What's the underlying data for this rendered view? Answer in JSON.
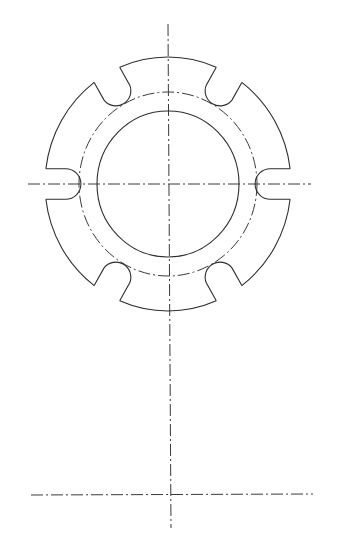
{
  "drawing": {
    "title": "Flange plate with radial slots",
    "type": "technical-drawing",
    "colors": {
      "line": "#2e2e2e",
      "centerline": "#3a3a3a",
      "background": "#ffffff"
    },
    "center": {
      "x": 168,
      "y": 184
    },
    "outer_circle": {
      "rx": 123,
      "ry": 127
    },
    "bolt_circle": {
      "rx": 89,
      "ry": 92,
      "style": "dash-dot"
    },
    "inner_circle": {
      "rx": 71,
      "ry": 73
    },
    "slots": {
      "count": 6,
      "angles_deg": [
        0,
        60,
        120,
        180,
        240,
        300
      ],
      "half_width": 15,
      "end_radius_center": 104
    },
    "centerlines": {
      "vertical": {
        "x1": 168,
        "y1": 24,
        "x2": 171,
        "y2": 528
      },
      "horizontal_top": {
        "x1": 28,
        "y1": 184,
        "x2": 311,
        "y2": 184
      },
      "horizontal_bottom": {
        "x1": 31,
        "y1": 495,
        "x2": 313,
        "y2": 494
      }
    }
  }
}
